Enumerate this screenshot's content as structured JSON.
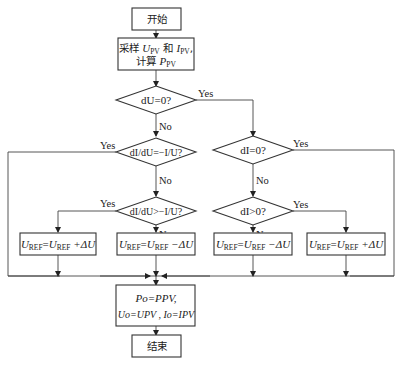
{
  "flowchart": {
    "start": "开始",
    "sample": {
      "line1_prefix": "采样 ",
      "u_var": "U",
      "u_sub": "PV",
      "and": " 和 ",
      "i_var": "I",
      "i_sub": "PV",
      "line1_suffix": ",",
      "line2_prefix": "计算 ",
      "p_var": "P",
      "p_sub": "PV"
    },
    "decisions": {
      "du_zero": "dU=0?",
      "didu_eq": "dI/dU=−I/U?",
      "didu_gt": "dI/dU>−I/U?",
      "di_zero": "dI=0?",
      "di_gt": "dI>0?"
    },
    "labels": {
      "yes": "Yes",
      "no": "No"
    },
    "actions": {
      "inc_left": {
        "lhs": "U",
        "lhs_sub": "REF",
        "eq": "=",
        "rhs": "U",
        "rhs_sub": "REF",
        "op": " +ΔU"
      },
      "dec_left": {
        "lhs": "U",
        "lhs_sub": "REF",
        "eq": "=",
        "rhs": "U",
        "rhs_sub": "REF",
        "op": " −ΔU"
      },
      "dec_right": {
        "lhs": "U",
        "lhs_sub": "REF",
        "eq": "=",
        "rhs": "U",
        "rhs_sub": "REF",
        "op": " −ΔU"
      },
      "inc_right": {
        "lhs": "U",
        "lhs_sub": "REF",
        "eq": "=",
        "rhs": "U",
        "rhs_sub": "REF",
        "op": " +ΔU"
      }
    },
    "update": {
      "line1": "Po=PPV,",
      "line2": "Uo=UPV , Io=IPV"
    },
    "end": "结束"
  }
}
